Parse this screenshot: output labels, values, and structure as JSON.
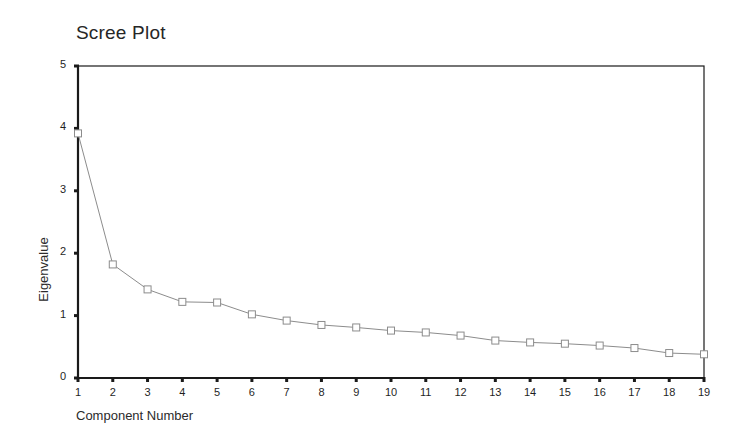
{
  "chart_data": {
    "type": "line",
    "title": "Scree Plot",
    "xlabel": "Component Number",
    "ylabel": "Eigenvalue",
    "x": [
      1,
      2,
      3,
      4,
      5,
      6,
      7,
      8,
      9,
      10,
      11,
      12,
      13,
      14,
      15,
      16,
      17,
      18,
      19
    ],
    "values": [
      3.92,
      1.82,
      1.42,
      1.22,
      1.21,
      1.02,
      0.92,
      0.85,
      0.81,
      0.76,
      0.73,
      0.68,
      0.6,
      0.57,
      0.55,
      0.52,
      0.48,
      0.4,
      0.38
    ],
    "categories": [
      "1",
      "2",
      "3",
      "4",
      "5",
      "6",
      "7",
      "8",
      "9",
      "10",
      "11",
      "12",
      "13",
      "14",
      "15",
      "16",
      "17",
      "18",
      "19"
    ],
    "xlim": [
      1,
      19
    ],
    "ylim": [
      0,
      5
    ],
    "ytick_labels": [
      "0",
      "1",
      "2",
      "3",
      "4",
      "5"
    ],
    "ytick_values": [
      0,
      1,
      2,
      3,
      4,
      5
    ],
    "grid": false,
    "legend": "none",
    "marker": "open-square",
    "line_color": "#8c8c8c",
    "marker_color": "#8c8c8c",
    "axis_color": "#1a1a1a",
    "background": "#ffffff"
  }
}
